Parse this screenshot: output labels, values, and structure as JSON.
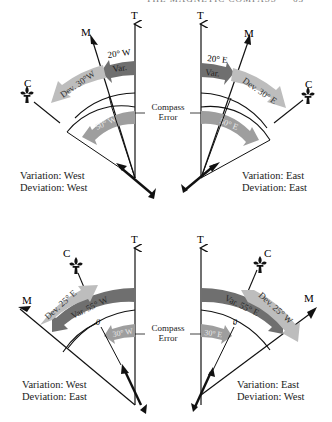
{
  "header": {
    "running_title": "THE MAGNETIC COMPASS",
    "page_number": "63"
  },
  "compass_error_label": {
    "line1": "Compass",
    "line2": "Error"
  },
  "colors": {
    "variation_arrow": "#6f6f6f",
    "deviation_arrow": "#bdbdbd",
    "compass_error_arrow": "#9e9e9e",
    "lines": "#111111",
    "background": "#ffffff"
  },
  "axis_labels": {
    "true_north": "T",
    "magnetic_north": "M",
    "compass_north": "C"
  },
  "panels": [
    {
      "id": "top-left",
      "variation_label": "Var.",
      "variation_value": "20° W",
      "deviation_label": "Dev. 30°W",
      "compass_error_value": "50° W",
      "caption_line1": "Variation: West",
      "caption_line2": "Deviation: West"
    },
    {
      "id": "top-right",
      "variation_label": "Var.",
      "variation_value": "20° E",
      "deviation_label": "Dev. 30° E",
      "compass_error_value": "50° E",
      "caption_line1": "Variation: East",
      "caption_line2": "Deviation: East"
    },
    {
      "id": "bottom-left",
      "variation_label": "Var. 55° W",
      "deviation_label": "Dev. 25° E",
      "compass_error_value": "30° W",
      "zero_mark": "0",
      "caption_line1": "Variation: West",
      "caption_line2": "Deviation: East"
    },
    {
      "id": "bottom-right",
      "variation_label": "Var. 55° E",
      "deviation_label": "Dev. 25° W",
      "compass_error_value": "30° E",
      "zero_mark": "0",
      "caption_line1": "Variation: East",
      "caption_line2": "Deviation: West"
    }
  ]
}
